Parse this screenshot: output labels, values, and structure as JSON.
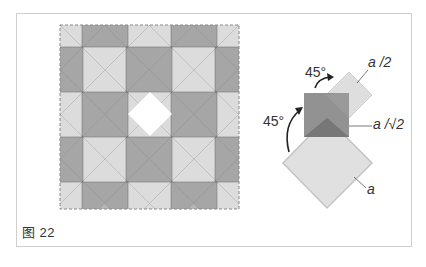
{
  "figure": {
    "caption": "图 22",
    "tiling": {
      "description": "Periodic tiling of overlapping translucent gray squares (axis-aligned dark squares and 45°-rotated light squares) inside a dashed square frame",
      "colors": {
        "dark_square": "#8c8c8c",
        "light_square": "#d9d9d9",
        "dashed_border": "#888888"
      }
    },
    "construction": {
      "rotation_labels": [
        "45°",
        "45°"
      ],
      "side_labels": {
        "small_square": "a /2",
        "middle_square": "a /√2",
        "large_square": "a"
      },
      "colors": {
        "middle_square": "#8c8c8c",
        "small_square": "#dedede",
        "large_square": "#e0e0e0",
        "large_square_border": "#c4c4c4",
        "overlap": "#777777"
      }
    }
  }
}
